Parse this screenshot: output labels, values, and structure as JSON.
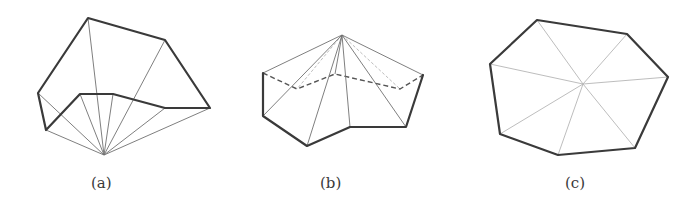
{
  "figure": {
    "panels": [
      {
        "id": "a",
        "label": "(a)",
        "description": "Polygon triangulated by fan from a point outside the polygon"
      },
      {
        "id": "b",
        "label": "(b)",
        "description": "Polygon lifted as a pyramid from an apex, hidden edges dashed"
      },
      {
        "id": "c",
        "label": "(c)",
        "description": "Convex heptagon triangulated by fan from an interior point"
      }
    ]
  }
}
